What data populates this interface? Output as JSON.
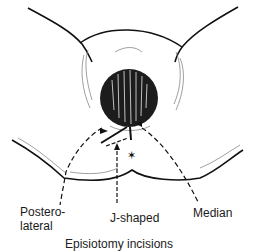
{
  "figure": {
    "labels": {
      "posterolateral": "Postero-\nlateral",
      "posterolateral_line1": "Postero-",
      "posterolateral_line2": "lateral",
      "j_shaped": "J-shaped",
      "median": "Median"
    },
    "caption_partial": "Episiotomy incisions"
  },
  "colors": {
    "ink": "#111111",
    "background": "#ffffff",
    "hatch": "#666666"
  }
}
